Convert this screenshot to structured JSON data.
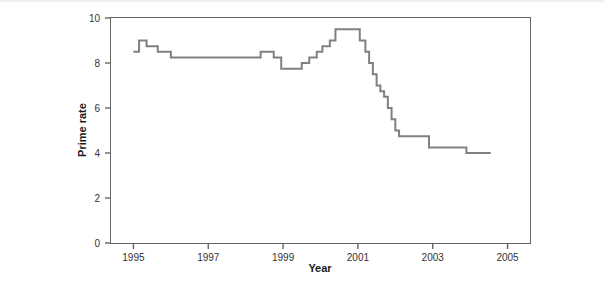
{
  "chart_data": {
    "type": "line",
    "title": "",
    "xlabel": "Year",
    "ylabel": "Prime rate",
    "xlim": [
      1994.4,
      2005.6
    ],
    "ylim": [
      0,
      10
    ],
    "xticks": [
      1995,
      1997,
      1999,
      2001,
      2003,
      2005
    ],
    "xtick_labels": [
      "1995",
      "1997",
      "1999",
      "2001",
      "2003",
      "2005"
    ],
    "yticks": [
      0,
      2,
      4,
      6,
      8,
      10
    ],
    "ytick_labels": [
      "0",
      "2",
      "4",
      "6",
      "8",
      "10"
    ],
    "grid": false,
    "legend": null,
    "drawstyle": "steps-post",
    "line_color": "#808080",
    "line_width": 2,
    "series": [
      {
        "name": "Prime rate",
        "x": [
          1995.0,
          1995.15,
          1995.35,
          1995.65,
          1996.0,
          1996.25,
          1998.4,
          1998.75,
          1998.95,
          1999.5,
          1999.7,
          1999.9,
          2000.05,
          2000.25,
          2000.4,
          2000.6,
          2001.05,
          2001.2,
          2001.3,
          2001.4,
          2001.5,
          2001.6,
          2001.7,
          2001.8,
          2001.9,
          2002.0,
          2002.1,
          2002.25,
          2002.9,
          2003.5,
          2003.9,
          2004.55
        ],
        "y": [
          8.5,
          9.0,
          8.75,
          8.5,
          8.25,
          8.25,
          8.5,
          8.25,
          7.75,
          8.0,
          8.25,
          8.5,
          8.75,
          9.0,
          9.5,
          9.5,
          9.0,
          8.5,
          8.0,
          7.5,
          7.0,
          6.75,
          6.5,
          6.0,
          5.5,
          5.0,
          4.75,
          4.75,
          4.25,
          4.25,
          4.0,
          4.0
        ]
      }
    ]
  },
  "axes": {
    "ylabel": "Prime rate",
    "xlabel": "Year"
  }
}
